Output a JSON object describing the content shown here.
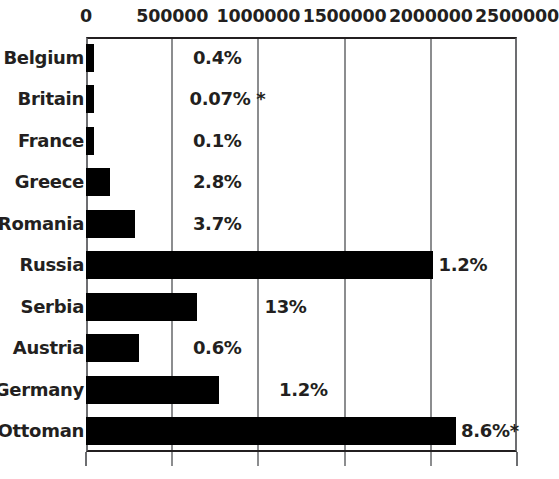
{
  "chart_data": {
    "type": "bar",
    "orientation": "horizontal",
    "title": "",
    "subtitle": "",
    "xlabel": "",
    "ylabel": "",
    "xlim": [
      0,
      2500000
    ],
    "xticks": [
      0,
      500000,
      1000000,
      1500000,
      2000000,
      2500000
    ],
    "xtick_labels": [
      "0",
      "500000",
      "1000000",
      "1500000",
      "2000000",
      "2500000"
    ],
    "grid": true,
    "grid_axis": "x",
    "legend": false,
    "bar_color": "#000000",
    "grid_color": "#8c8d8f",
    "frame_color": "#231f20",
    "background": "#ffffff",
    "categories": [
      "Belgium",
      "Britain",
      "France",
      "Greece",
      "Romania",
      "Russia",
      "Serbia",
      "Austria",
      "Germany",
      "Ottoman"
    ],
    "values": [
      45000,
      45000,
      45000,
      140000,
      285000,
      2010000,
      645000,
      310000,
      770000,
      2145000
    ],
    "annotations": [
      "0.4%",
      "0.07% *",
      "0.1%",
      "2.8%",
      "3.7%",
      "1.2%",
      "13%",
      "0.6%",
      "1.2%",
      "8.6%*"
    ],
    "annotation_x": [
      620000,
      600000,
      620000,
      620000,
      620000,
      2045000,
      1035000,
      620000,
      1120000,
      2175000
    ]
  }
}
